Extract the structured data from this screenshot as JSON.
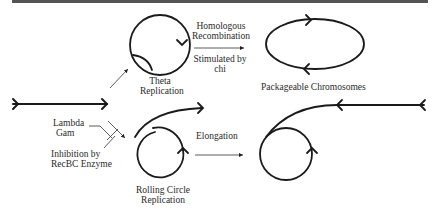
{
  "figure": {
    "type": "lambda phage DNA replication pathways diagram",
    "stroke_color": "#1a1a1a",
    "labels": {
      "theta_line1": "Theta",
      "theta_line2": "Replication",
      "homologous_line1": "Homologous",
      "homologous_line2": "Recombination",
      "stimulated_line1": "Stimulated by",
      "stimulated_line2": "chi",
      "packageable": "Packageable  Chromosomes",
      "lambda_line1": "Lambda",
      "lambda_line2": "Gam",
      "inhibition_line1": "Inhibition by",
      "inhibition_line2": "RecBC Enzyme",
      "elongation": "Elongation",
      "rolling_line1": "Rolling Circle",
      "rolling_line2": "Replication"
    },
    "nodes": [
      {
        "id": "linear-dna",
        "shape": "linear arrow"
      },
      {
        "id": "theta-circle",
        "shape": "circle with replication bubble"
      },
      {
        "id": "packageable-chromosomes",
        "shape": "ellipse with two arrowheads"
      },
      {
        "id": "rolling-circle-early",
        "shape": "circle with tail"
      },
      {
        "id": "rolling-circle-late",
        "shape": "circle with long tail"
      }
    ],
    "edges": [
      {
        "from": "linear-dna",
        "to": "theta-circle"
      },
      {
        "from": "theta-circle",
        "to": "packageable-chromosomes",
        "label": "Homologous Recombination / Stimulated by chi"
      },
      {
        "from": "linear-dna",
        "to": "rolling-circle-early",
        "modifier": "Lambda Gam inhibits RecBC"
      },
      {
        "from": "rolling-circle-early",
        "to": "rolling-circle-late",
        "label": "Elongation"
      }
    ]
  }
}
